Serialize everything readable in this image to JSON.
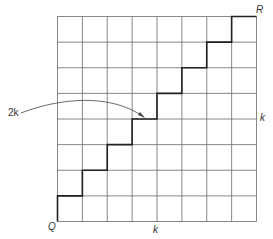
{
  "diagram": {
    "grid": {
      "rows": 8,
      "cols": 8
    },
    "labels": {
      "origin": "Q",
      "top_right": "R",
      "bottom_side": "k",
      "right_side": "k",
      "path_annotation": "2k"
    },
    "path": "staircase from Q to R: alternating up one unit, right one unit, 8 steps each",
    "colors": {
      "grid": "#555555",
      "path": "#222222",
      "arrow": "#444444"
    }
  }
}
